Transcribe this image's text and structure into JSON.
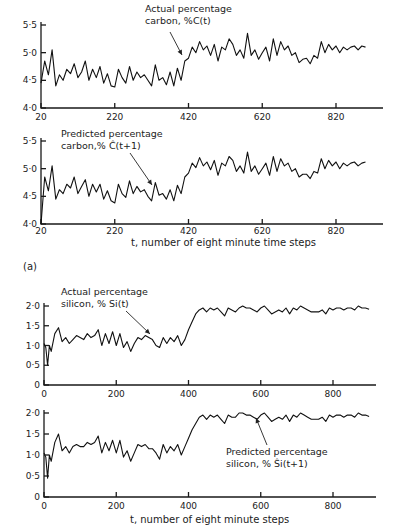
{
  "figure_label": "(a)",
  "carbon_caption": "t, number of eight minute time steps",
  "silicon_caption": "t, number of eight minute steps",
  "chart_data": [
    {
      "type": "line",
      "id": "carbon-actual",
      "title": "",
      "annotation": [
        "Actual percentage",
        "carbon, %C(t)"
      ],
      "xlabel": "",
      "ylabel": "",
      "xlim": [
        20,
        920
      ],
      "ylim": [
        4.0,
        5.5
      ],
      "xticks": [
        20,
        220,
        420,
        620,
        820
      ],
      "yticks": [
        4.0,
        4.5,
        5.0,
        5.5
      ],
      "ytick_labels": [
        "4·0",
        "4·5",
        "5·0",
        "5·5"
      ],
      "x": [
        20,
        30,
        40,
        50,
        60,
        70,
        80,
        90,
        100,
        110,
        120,
        130,
        140,
        150,
        160,
        170,
        180,
        190,
        200,
        210,
        220,
        230,
        240,
        250,
        260,
        270,
        280,
        290,
        300,
        310,
        320,
        330,
        340,
        350,
        360,
        370,
        380,
        390,
        400,
        410,
        420,
        430,
        440,
        450,
        460,
        470,
        480,
        490,
        500,
        510,
        520,
        530,
        540,
        550,
        560,
        570,
        580,
        590,
        600,
        610,
        620,
        630,
        640,
        650,
        660,
        670,
        680,
        690,
        700,
        710,
        720,
        730,
        740,
        750,
        760,
        770,
        780,
        790,
        800,
        810,
        820,
        830,
        840,
        850,
        860,
        870,
        880,
        890,
        900
      ],
      "values": [
        4.45,
        4.85,
        4.6,
        5.05,
        4.4,
        4.6,
        4.5,
        4.7,
        4.62,
        4.8,
        4.55,
        4.65,
        4.85,
        4.5,
        4.7,
        4.55,
        4.75,
        4.45,
        4.62,
        4.4,
        4.38,
        4.7,
        4.55,
        4.45,
        4.75,
        4.5,
        4.65,
        4.55,
        4.6,
        4.5,
        4.4,
        4.78,
        4.5,
        4.55,
        4.42,
        4.65,
        4.4,
        4.72,
        4.5,
        4.85,
        4.9,
        5.1,
        5.0,
        5.2,
        5.05,
        5.12,
        4.95,
        5.15,
        4.85,
        5.1,
        5.05,
        5.25,
        5.15,
        4.95,
        5.05,
        4.9,
        5.35,
        4.95,
        5.05,
        4.88,
        5.0,
        5.1,
        4.85,
        5.25,
        4.95,
        5.2,
        5.05,
        5.12,
        4.95,
        5.0,
        4.82,
        4.88,
        4.9,
        4.8,
        4.95,
        4.9,
        5.2,
        5.0,
        5.15,
        5.05,
        5.12,
        5.0,
        5.1,
        5.05,
        5.1,
        5.12,
        5.05,
        5.12,
        5.1
      ]
    },
    {
      "type": "line",
      "id": "carbon-predicted",
      "title": "",
      "annotation": [
        "Predicted percentage",
        "carbon,% Ĉ(t+1)"
      ],
      "xlabel": "t, number of eight minute time steps",
      "ylabel": "",
      "xlim": [
        20,
        920
      ],
      "ylim": [
        4.0,
        5.5
      ],
      "xticks": [
        20,
        220,
        420,
        620,
        820
      ],
      "yticks": [
        4.0,
        4.5,
        5.0,
        5.5
      ],
      "ytick_labels": [
        "4·0",
        "4·5",
        "5·0",
        "5·5"
      ],
      "x": [
        20,
        30,
        40,
        50,
        60,
        70,
        80,
        90,
        100,
        110,
        120,
        130,
        140,
        150,
        160,
        170,
        180,
        190,
        200,
        210,
        220,
        230,
        240,
        250,
        260,
        270,
        280,
        290,
        300,
        310,
        320,
        330,
        340,
        350,
        360,
        370,
        380,
        390,
        400,
        410,
        420,
        430,
        440,
        450,
        460,
        470,
        480,
        490,
        500,
        510,
        520,
        530,
        540,
        550,
        560,
        570,
        580,
        590,
        600,
        610,
        620,
        630,
        640,
        650,
        660,
        670,
        680,
        690,
        700,
        710,
        720,
        730,
        740,
        750,
        760,
        770,
        780,
        790,
        800,
        810,
        820,
        830,
        840,
        850,
        860,
        870,
        880,
        890,
        900
      ],
      "values": [
        4.0,
        4.85,
        4.6,
        5.05,
        4.45,
        4.62,
        4.55,
        4.72,
        4.65,
        4.85,
        4.55,
        4.68,
        4.8,
        4.5,
        4.72,
        4.58,
        4.72,
        4.45,
        4.6,
        4.42,
        4.38,
        4.72,
        4.55,
        4.48,
        4.78,
        4.55,
        4.68,
        4.58,
        4.62,
        4.5,
        4.42,
        4.75,
        4.52,
        4.55,
        4.45,
        4.62,
        4.42,
        4.7,
        4.55,
        4.85,
        4.92,
        5.1,
        5.02,
        5.2,
        5.05,
        5.12,
        4.98,
        5.15,
        4.88,
        5.1,
        5.05,
        5.22,
        5.15,
        4.95,
        5.05,
        4.92,
        5.3,
        4.95,
        5.05,
        4.9,
        5.0,
        5.1,
        4.88,
        5.22,
        4.95,
        5.18,
        5.05,
        5.1,
        4.95,
        5.0,
        4.85,
        4.9,
        4.9,
        4.82,
        4.95,
        4.92,
        5.18,
        5.0,
        5.15,
        5.05,
        5.12,
        5.0,
        5.1,
        5.05,
        5.1,
        5.12,
        5.05,
        5.1,
        5.12
      ]
    },
    {
      "type": "line",
      "id": "silicon-actual",
      "title": "",
      "annotation": [
        "Actual percentage",
        "silicon, % Si(t)"
      ],
      "xlabel": "",
      "ylabel": "",
      "xlim": [
        0,
        920
      ],
      "ylim": [
        0,
        2.0
      ],
      "xticks": [
        0,
        200,
        400,
        600,
        800
      ],
      "yticks": [
        0,
        0.5,
        1.0,
        1.5,
        2.0
      ],
      "ytick_labels": [
        "0",
        "0·5",
        "1·0",
        "1·5",
        "2·0"
      ],
      "x": [
        0,
        5,
        10,
        15,
        20,
        30,
        40,
        50,
        60,
        70,
        80,
        90,
        100,
        110,
        120,
        130,
        140,
        150,
        160,
        170,
        180,
        190,
        200,
        210,
        220,
        230,
        240,
        250,
        260,
        270,
        280,
        290,
        300,
        310,
        320,
        330,
        340,
        350,
        360,
        370,
        380,
        390,
        400,
        410,
        420,
        430,
        440,
        450,
        460,
        470,
        480,
        490,
        500,
        510,
        520,
        530,
        540,
        550,
        560,
        570,
        580,
        590,
        600,
        610,
        620,
        630,
        640,
        650,
        660,
        670,
        680,
        690,
        700,
        710,
        720,
        730,
        740,
        750,
        760,
        770,
        780,
        790,
        800,
        810,
        820,
        830,
        840,
        850,
        860,
        870,
        880,
        890,
        900
      ],
      "values": [
        1.05,
        0.95,
        0.5,
        1.0,
        0.85,
        1.3,
        1.45,
        1.1,
        1.2,
        1.05,
        1.15,
        1.25,
        1.2,
        1.15,
        1.3,
        1.2,
        1.25,
        1.4,
        1.0,
        1.3,
        1.05,
        1.35,
        1.0,
        1.3,
        0.95,
        1.1,
        0.85,
        1.05,
        1.2,
        1.15,
        1.25,
        1.2,
        1.15,
        1.0,
        0.95,
        1.2,
        1.05,
        1.2,
        1.1,
        1.25,
        1.0,
        1.15,
        1.4,
        1.6,
        1.8,
        1.9,
        1.95,
        1.85,
        1.95,
        1.9,
        1.95,
        1.85,
        1.75,
        1.95,
        1.9,
        1.85,
        1.95,
        2.0,
        1.95,
        1.95,
        1.9,
        1.85,
        1.95,
        2.0,
        1.9,
        1.8,
        1.85,
        1.9,
        1.85,
        1.95,
        1.8,
        1.95,
        1.9,
        2.0,
        1.95,
        1.9,
        1.85,
        1.85,
        1.85,
        1.9,
        1.8,
        1.95,
        1.9,
        1.95,
        1.95,
        1.9,
        1.95,
        1.95,
        1.9,
        2.0,
        1.95,
        1.95,
        1.92
      ]
    },
    {
      "type": "line",
      "id": "silicon-predicted",
      "title": "",
      "annotation": [
        "Predicted percentage",
        "silicon, % Ŝi(t+1)"
      ],
      "xlabel": "t, number of eight minute steps",
      "ylabel": "",
      "xlim": [
        0,
        920
      ],
      "ylim": [
        0,
        2.0
      ],
      "xticks": [
        0,
        200,
        400,
        600,
        800
      ],
      "yticks": [
        0,
        0.5,
        1.0,
        1.5,
        2.0
      ],
      "ytick_labels": [
        "0",
        "0·5",
        "1·0",
        "1·5",
        "2·0"
      ],
      "x": [
        0,
        5,
        10,
        15,
        20,
        30,
        40,
        50,
        60,
        70,
        80,
        90,
        100,
        110,
        120,
        130,
        140,
        150,
        160,
        170,
        180,
        190,
        200,
        210,
        220,
        230,
        240,
        250,
        260,
        270,
        280,
        290,
        300,
        310,
        320,
        330,
        340,
        350,
        360,
        370,
        380,
        390,
        400,
        410,
        420,
        430,
        440,
        450,
        460,
        470,
        480,
        490,
        500,
        510,
        520,
        530,
        540,
        550,
        560,
        570,
        580,
        590,
        600,
        610,
        620,
        630,
        640,
        650,
        660,
        670,
        680,
        690,
        700,
        710,
        720,
        730,
        740,
        750,
        760,
        770,
        780,
        790,
        800,
        810,
        820,
        830,
        840,
        850,
        860,
        870,
        880,
        890,
        900
      ],
      "values": [
        1.05,
        0.95,
        0.45,
        1.0,
        0.85,
        1.3,
        1.5,
        1.1,
        1.2,
        1.05,
        1.2,
        1.25,
        1.2,
        1.2,
        1.3,
        1.25,
        1.3,
        1.45,
        1.05,
        1.3,
        1.1,
        1.35,
        1.05,
        1.35,
        0.95,
        1.1,
        0.85,
        1.05,
        1.25,
        1.2,
        1.25,
        1.15,
        1.15,
        1.05,
        0.9,
        1.25,
        1.05,
        1.2,
        1.1,
        1.25,
        1.0,
        1.2,
        1.4,
        1.6,
        1.75,
        1.9,
        1.95,
        1.85,
        1.95,
        1.9,
        1.95,
        1.85,
        1.75,
        1.95,
        1.9,
        1.9,
        2.0,
        2.0,
        1.95,
        1.95,
        1.9,
        1.85,
        1.95,
        2.0,
        1.9,
        1.8,
        1.85,
        1.9,
        1.85,
        1.95,
        1.8,
        1.95,
        1.9,
        2.0,
        1.95,
        1.9,
        1.85,
        1.85,
        1.85,
        1.9,
        1.8,
        1.95,
        1.9,
        1.95,
        1.95,
        1.9,
        1.95,
        1.95,
        1.9,
        2.0,
        1.95,
        1.95,
        1.92
      ]
    }
  ]
}
